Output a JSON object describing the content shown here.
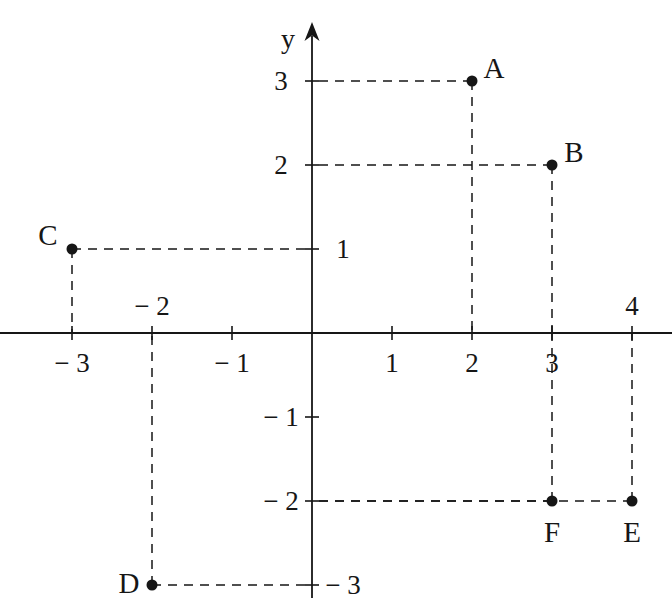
{
  "figure": {
    "kind": "cartesian-coordinate-plane",
    "background_color": "#ffffff",
    "ink_color": "#161616",
    "axis_labels": {
      "y": "y"
    }
  },
  "chart_data": {
    "type": "scatter",
    "title": "",
    "xlabel": "",
    "ylabel": "y",
    "grid": false,
    "legend": false,
    "xlim": [
      -3.9,
      4.5
    ],
    "ylim": [
      -3.15,
      3.35
    ],
    "x_ticks": [
      -3,
      -2,
      -1,
      1,
      2,
      3,
      4
    ],
    "y_ticks": [
      -3,
      -2,
      -1,
      1,
      2,
      3
    ],
    "x_tick_labels": [
      "− 3",
      "− 2",
      "− 1",
      "1",
      "2",
      "3",
      "4"
    ],
    "y_tick_labels": [
      "− 3",
      "− 2",
      "− 1",
      "1",
      "2",
      "3"
    ],
    "points": [
      {
        "label": "A",
        "x": 2,
        "y": 3
      },
      {
        "label": "B",
        "x": 3,
        "y": 2
      },
      {
        "label": "C",
        "x": -3,
        "y": 1
      },
      {
        "label": "D",
        "x": -2,
        "y": -3
      },
      {
        "label": "E",
        "x": 4,
        "y": -2
      },
      {
        "label": "F",
        "x": 3,
        "y": -2
      }
    ],
    "guide_lines": "dashed leader lines from each point to both axes"
  },
  "geometry": {
    "origin_px": {
      "x": 312,
      "y": 333
    },
    "unit_px": {
      "x": 80,
      "y": 84
    },
    "x_axis": {
      "from_px": 0,
      "to_px": 672
    },
    "y_axis": {
      "top_px": 22,
      "bottom_px": 598
    },
    "y_arrow": true,
    "tick_half_len_px": 7,
    "dot_radius_px": 5.5
  },
  "tick_label_placement": {
    "x": {
      "-3": "below",
      "-2": "above",
      "-1": "below",
      "1": "below",
      "2": "below",
      "3": "below",
      "4": "above"
    },
    "y": {
      "3": "left",
      "2": "left",
      "1": "right",
      "-1": "left",
      "-2": "left",
      "-3": "right"
    }
  },
  "point_label_offsets": {
    "A": {
      "dx": 22,
      "dy": -13
    },
    "B": {
      "dx": 22,
      "dy": -13
    },
    "C": {
      "dx": -24,
      "dy": -14
    },
    "D": {
      "dx": -23,
      "dy": -2
    },
    "E": {
      "dx": 0,
      "dy": 31
    },
    "F": {
      "dx": 0,
      "dy": 31
    }
  }
}
